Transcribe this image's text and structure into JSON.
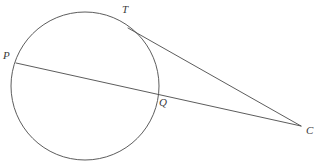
{
  "figure": {
    "name": "circle-tangent-secant-diagram",
    "background_color": "#ffffff",
    "stroke_color": "#4a4a4a",
    "label_color": "#3a3a3a",
    "stroke_width": 0.9,
    "width": 321,
    "height": 163
  },
  "circle": {
    "name": "main-circle",
    "center_x": 85,
    "center_y": 86,
    "radius": 74
  },
  "points": {
    "P": {
      "label": "P",
      "x": 16,
      "y": 63,
      "label_x": 3,
      "label_y": 50
    },
    "T": {
      "label": "T",
      "x": 128,
      "y": 28,
      "label_x": 122,
      "label_y": 4
    },
    "Q": {
      "label": "Q",
      "x": 157,
      "y": 96,
      "label_x": 159,
      "label_y": 97
    },
    "C": {
      "label": "C",
      "x": 301,
      "y": 126,
      "label_x": 306,
      "label_y": 125
    }
  },
  "lines": {
    "tangent": {
      "name": "tangent-line-TC",
      "from": "T",
      "to": "C",
      "x1": 128,
      "y1": 28,
      "x2": 301,
      "y2": 126
    },
    "secant": {
      "name": "secant-line-PC",
      "from": "P",
      "to": "C",
      "x1": 16,
      "y1": 63,
      "x2": 301,
      "y2": 126
    }
  }
}
